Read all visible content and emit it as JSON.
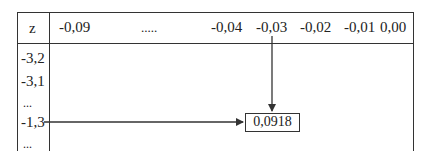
{
  "table": {
    "corner_label": "z",
    "column_headers": [
      "-0,09",
      ".....",
      "-0,04",
      "-0,03",
      "-0,02",
      "-0,01",
      "0,00"
    ],
    "row_headers": [
      "-3,2",
      "-3,1",
      "...",
      "-1,3",
      "..."
    ]
  },
  "lookup": {
    "row": "-1,3",
    "column": "-0,03",
    "result": "0,0918"
  },
  "colors": {
    "line": "#333333",
    "text": "#222222",
    "background": "#ffffff"
  }
}
